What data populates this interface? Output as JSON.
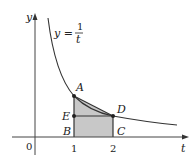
{
  "figure": {
    "equation": {
      "lhs": "y =",
      "numerator": "1",
      "denominator": "t"
    },
    "axes": {
      "x_label": "t",
      "y_label": "y",
      "origin_label": "0",
      "ticks": [
        "1",
        "2"
      ]
    },
    "points": {
      "A": "A",
      "B": "B",
      "C": "C",
      "D": "D",
      "E": "E"
    },
    "colors": {
      "shade": "#c8c8c8",
      "line": "#333333",
      "background": "#ffffff"
    }
  }
}
